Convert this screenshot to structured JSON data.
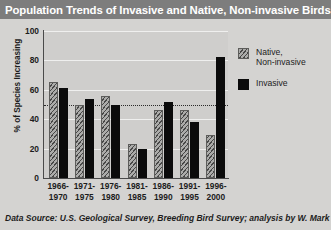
{
  "header": {
    "title": "Population Trends of Invasive and Native, Non-invasive Birds",
    "bar_color": "#7d7d7d",
    "text_color": "#ffffff"
  },
  "footnote": {
    "text": "Data Source: U.S. Geological Survey, Breeding Bird Survey; analysis by W. Mark"
  },
  "legend": {
    "position": "right",
    "entries": [
      {
        "name": "native-non-invasive",
        "line1": "Native,",
        "line2": "Non-invasive",
        "color": "#8a8a88",
        "pattern": "diagonal-hatch"
      },
      {
        "name": "invasive",
        "line1": "Invasive",
        "line2": "",
        "color": "#0b0b0b",
        "pattern": "solid"
      }
    ]
  },
  "chart_data": {
    "type": "bar",
    "title": "Population Trends of Invasive and Native, Non-invasive Birds",
    "xlabel": "",
    "ylabel": "% of Species Increasing",
    "ylim": [
      0,
      100
    ],
    "yticks": [
      0,
      20,
      40,
      60,
      80,
      100
    ],
    "ytick_labels": [
      "0",
      "20",
      "40",
      "60",
      "80",
      "100"
    ],
    "grid": true,
    "reference_line": {
      "value": 50,
      "style": "dotted",
      "color": "#2a2a2a"
    },
    "categories": [
      "1966-\n1970",
      "1971-\n1975",
      "1976-\n1980",
      "1981-\n1985",
      "1986-\n1990",
      "1991-\n1995",
      "1996-\n2000"
    ],
    "category_lines": [
      {
        "top": "1966-",
        "bottom": "1970"
      },
      {
        "top": "1971-",
        "bottom": "1975"
      },
      {
        "top": "1976-",
        "bottom": "1980"
      },
      {
        "top": "1981-",
        "bottom": "1985"
      },
      {
        "top": "1986-",
        "bottom": "1990"
      },
      {
        "top": "1991-",
        "bottom": "1995"
      },
      {
        "top": "1996-",
        "bottom": "2000"
      }
    ],
    "series": [
      {
        "name": "Native, Non-invasive",
        "color": "#8a8a88",
        "values": [
          65,
          50,
          56,
          23,
          46,
          46,
          29
        ]
      },
      {
        "name": "Invasive",
        "color": "#0b0b0b",
        "values": [
          61,
          54,
          50,
          20,
          52,
          38,
          82
        ]
      }
    ]
  }
}
